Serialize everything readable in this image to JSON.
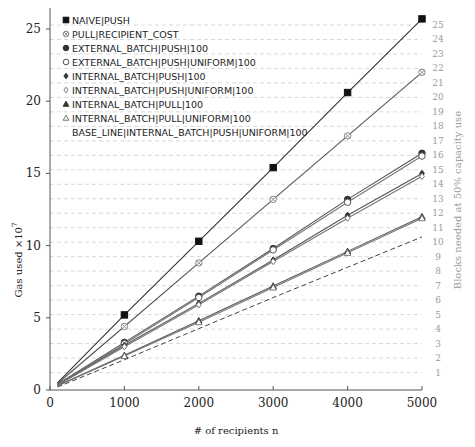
{
  "chart_data": {
    "type": "line",
    "title": "",
    "xlabel": "# of recipients n",
    "ylabel": "Gas used ×10^7",
    "ylabel_main": "Gas used ×10",
    "ylabel_exp": "7",
    "y2label": "Blocks needed at 50% capacity use",
    "xlim": [
      0,
      5000
    ],
    "ylim": [
      0,
      26
    ],
    "y2lim": [
      0,
      25
    ],
    "xticks": [
      0,
      1000,
      2000,
      3000,
      4000,
      5000
    ],
    "yticks": [
      0,
      5,
      10,
      15,
      20,
      25
    ],
    "y2ticks": [
      1,
      2,
      3,
      4,
      5,
      6,
      7,
      8,
      9,
      10,
      11,
      12,
      13,
      14,
      15,
      16,
      17,
      18,
      19,
      20,
      21,
      22,
      23,
      24,
      25
    ],
    "grid": "horizontal dashed at each block level",
    "legend_position": "upper left",
    "x": [
      100,
      1000,
      2000,
      3000,
      4000,
      5000
    ],
    "series": [
      {
        "name": "NAIVE|PUSH",
        "marker": "filled-square",
        "style": "solid",
        "color": "#333333",
        "values": [
          0.5,
          5.2,
          10.3,
          15.4,
          20.6,
          25.7
        ]
      },
      {
        "name": "PULL|RECIPIENT_COST",
        "marker": "circled-x",
        "style": "solid",
        "color": "#555555",
        "values": [
          0.45,
          4.4,
          8.8,
          13.2,
          17.6,
          22.0
        ]
      },
      {
        "name": "EXTERNAL_BATCH|PUSH|100",
        "marker": "filled-circle",
        "style": "solid",
        "color": "#555555",
        "values": [
          0.4,
          3.3,
          6.5,
          9.8,
          13.2,
          16.4
        ]
      },
      {
        "name": "EXTERNAL_BATCH|PUSH|UNIFORM|100",
        "marker": "open-circle",
        "style": "solid",
        "color": "#777777",
        "values": [
          0.38,
          3.2,
          6.4,
          9.7,
          13.0,
          16.2
        ]
      },
      {
        "name": "INTERNAL_BATCH|PUSH|100",
        "marker": "filled-diamond",
        "style": "solid",
        "color": "#555555",
        "values": [
          0.35,
          3.1,
          6.0,
          9.0,
          12.1,
          15.0
        ]
      },
      {
        "name": "INTERNAL_BATCH|PUSH|UNIFORM|100",
        "marker": "open-diamond",
        "style": "solid",
        "color": "#777777",
        "values": [
          0.33,
          3.0,
          5.9,
          8.9,
          11.9,
          14.8
        ]
      },
      {
        "name": "INTERNAL_BATCH|PULL|100",
        "marker": "filled-triangle",
        "style": "solid",
        "color": "#555555",
        "values": [
          0.3,
          2.4,
          4.8,
          7.2,
          9.6,
          12.0
        ]
      },
      {
        "name": "INTERNAL_BATCH|PULL|UNIFORM|100",
        "marker": "open-triangle",
        "style": "solid",
        "color": "#777777",
        "values": [
          0.28,
          2.35,
          4.7,
          7.1,
          9.5,
          11.9
        ]
      },
      {
        "name": "BASE_LINE|INTERNAL_BATCH|PUSH|UNIFORM|100",
        "marker": "none",
        "style": "dashed",
        "color": "#444444",
        "values": [
          0.2,
          2.1,
          4.25,
          6.4,
          8.5,
          10.6
        ]
      }
    ]
  }
}
